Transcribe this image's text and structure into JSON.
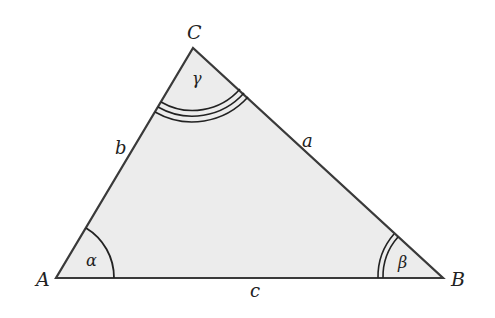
{
  "diagram": {
    "type": "triangle",
    "fill_color": "#ececec",
    "stroke_color": "#3a3a3a",
    "vertices": {
      "A": {
        "label": "A",
        "x": 56,
        "y": 278
      },
      "B": {
        "label": "B",
        "x": 443,
        "y": 278
      },
      "C": {
        "label": "C",
        "x": 193,
        "y": 48
      }
    },
    "sides": {
      "a": {
        "label": "a",
        "between": "B-C"
      },
      "b": {
        "label": "b",
        "between": "A-C"
      },
      "c": {
        "label": "c",
        "between": "A-B"
      }
    },
    "angles": {
      "alpha": {
        "label": "α",
        "vertex": "A",
        "arcs": 1
      },
      "beta": {
        "label": "β",
        "vertex": "B",
        "arcs": 2
      },
      "gamma": {
        "label": "γ",
        "vertex": "C",
        "arcs": 3
      }
    }
  }
}
